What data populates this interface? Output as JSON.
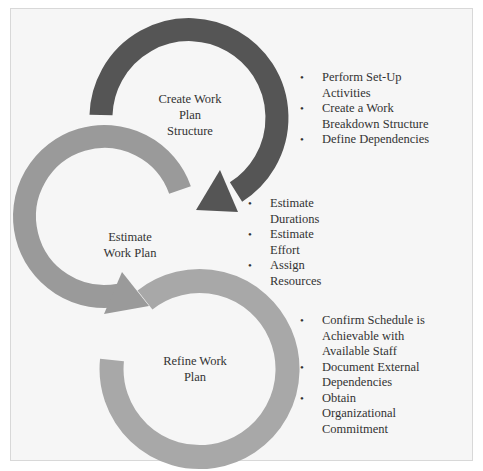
{
  "diagram": {
    "type": "cyclic-process",
    "colors": {
      "step1": "#555555",
      "step2": "#9a9a9a",
      "step3": "#a8a8a8",
      "background": "#f6f6f6",
      "border": "#d8d8d8"
    },
    "steps": [
      {
        "label": "Create Work Plan Structure",
        "label_lines": [
          "Create Work",
          "Plan",
          "Structure"
        ],
        "bullets": [
          "Perform Set-Up Activities",
          "Create a Work Breakdown Structure",
          "Define Dependencies"
        ],
        "bullet_lines": [
          [
            "Perform Set-Up",
            "Activities"
          ],
          [
            "Create a Work",
            "Breakdown Structure"
          ],
          [
            "Define Dependencies"
          ]
        ]
      },
      {
        "label": "Estimate Work Plan",
        "label_lines": [
          "Estimate",
          "Work Plan"
        ],
        "bullets": [
          "Estimate Durations",
          "Estimate Effort",
          "Assign Resources"
        ],
        "bullet_lines": [
          [
            "Estimate",
            "Durations"
          ],
          [
            "Estimate",
            "Effort"
          ],
          [
            "Assign",
            "Resources"
          ]
        ]
      },
      {
        "label": "Refine Work Plan",
        "label_lines": [
          "Refine Work",
          "Plan"
        ],
        "bullets": [
          "Confirm Schedule is Achievable with Available Staff",
          "Document External Dependencies",
          "Obtain Organizational Commitment"
        ],
        "bullet_lines": [
          [
            "Confirm Schedule is",
            "Achievable with",
            "Available Staff"
          ],
          [
            "Document External",
            "Dependencies"
          ],
          [
            "Obtain",
            "Organizational",
            "Commitment"
          ]
        ]
      }
    ]
  }
}
